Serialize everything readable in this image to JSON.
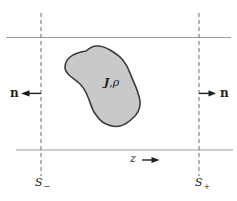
{
  "figure": {
    "region_label": {
      "j": "J",
      "comma_rho": ",ρ"
    },
    "left_normal_label": "n",
    "right_normal_label": "n",
    "axis_label": "z",
    "left_surface_label": {
      "base": "S",
      "sub": "−"
    },
    "right_surface_label": {
      "base": "S",
      "sub": "+"
    },
    "colors": {
      "background": "#ffffff",
      "blob_fill": "#c9c9c9",
      "blob_outline": "#3b3b3b",
      "boundary_lines": "#9a9a9a",
      "dashed_lines": "#6b6b6b",
      "arrows_and_text": "#1e1e1e"
    }
  }
}
